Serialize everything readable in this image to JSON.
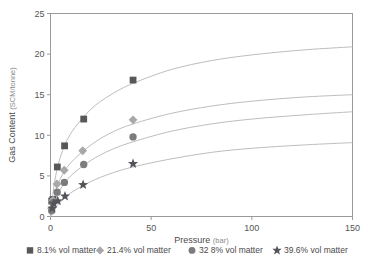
{
  "chart_data": {
    "type": "scatter",
    "title": "",
    "xlabel": "Pressure",
    "xunit": "(bar)",
    "ylabel": "Gas Content",
    "yunit": "(SCM/tonne)",
    "xlim": [
      0,
      150
    ],
    "ylim": [
      0,
      25
    ],
    "xticks": [
      0,
      50,
      100,
      150
    ],
    "yticks": [
      0,
      5,
      10,
      15,
      20,
      25
    ],
    "grid": false,
    "legend_position": "below",
    "series": [
      {
        "name": "8.1%  vol matter",
        "marker": "square",
        "color": "#58585a",
        "points": [
          {
            "x": 0.6,
            "y": 1.9
          },
          {
            "x": 1.2,
            "y": 2.1
          },
          {
            "x": 3.4,
            "y": 6.1
          },
          {
            "x": 7.0,
            "y": 8.7
          },
          {
            "x": 16.5,
            "y": 12.0
          },
          {
            "x": 41.0,
            "y": 16.8
          }
        ],
        "curve": [
          {
            "x": 0,
            "y": 0
          },
          {
            "x": 2,
            "y": 4.2
          },
          {
            "x": 5,
            "y": 7.4
          },
          {
            "x": 10,
            "y": 10.2
          },
          {
            "x": 20,
            "y": 13.2
          },
          {
            "x": 30,
            "y": 15.0
          },
          {
            "x": 41,
            "y": 16.4
          },
          {
            "x": 60,
            "y": 18.1
          },
          {
            "x": 80,
            "y": 19.2
          },
          {
            "x": 100,
            "y": 19.9
          },
          {
            "x": 125,
            "y": 20.5
          },
          {
            "x": 150,
            "y": 20.9
          }
        ]
      },
      {
        "name": "21.4% vol matter",
        "marker": "diamond",
        "color": "#a8a8aa",
        "points": [
          {
            "x": 0.6,
            "y": 1.0
          },
          {
            "x": 1.2,
            "y": 2.0
          },
          {
            "x": 3.2,
            "y": 4.0
          },
          {
            "x": 6.8,
            "y": 5.7
          },
          {
            "x": 16.0,
            "y": 8.1
          },
          {
            "x": 41.0,
            "y": 11.9
          }
        ],
        "curve": [
          {
            "x": 0,
            "y": 0
          },
          {
            "x": 2,
            "y": 2.6
          },
          {
            "x": 5,
            "y": 4.7
          },
          {
            "x": 10,
            "y": 6.6
          },
          {
            "x": 20,
            "y": 8.8
          },
          {
            "x": 30,
            "y": 10.3
          },
          {
            "x": 41,
            "y": 11.4
          },
          {
            "x": 60,
            "y": 12.7
          },
          {
            "x": 80,
            "y": 13.6
          },
          {
            "x": 100,
            "y": 14.2
          },
          {
            "x": 125,
            "y": 14.7
          },
          {
            "x": 150,
            "y": 15.0
          }
        ]
      },
      {
        "name": "32 8% vol matter",
        "marker": "circle",
        "color": "#7c7c7e",
        "points": [
          {
            "x": 0.6,
            "y": 0.7
          },
          {
            "x": 1.2,
            "y": 1.7
          },
          {
            "x": 3.3,
            "y": 3.0
          },
          {
            "x": 6.9,
            "y": 4.2
          },
          {
            "x": 16.5,
            "y": 6.4
          },
          {
            "x": 41.0,
            "y": 9.8
          }
        ],
        "curve": [
          {
            "x": 0,
            "y": 0
          },
          {
            "x": 2,
            "y": 1.8
          },
          {
            "x": 5,
            "y": 3.4
          },
          {
            "x": 10,
            "y": 5.0
          },
          {
            "x": 20,
            "y": 6.9
          },
          {
            "x": 30,
            "y": 8.2
          },
          {
            "x": 41,
            "y": 9.2
          },
          {
            "x": 60,
            "y": 10.5
          },
          {
            "x": 80,
            "y": 11.4
          },
          {
            "x": 100,
            "y": 12.0
          },
          {
            "x": 125,
            "y": 12.5
          },
          {
            "x": 150,
            "y": 12.9
          }
        ]
      },
      {
        "name": "39.6% vol matter",
        "marker": "star",
        "color": "#54545a",
        "points": [
          {
            "x": 0.9,
            "y": 1.0
          },
          {
            "x": 1.6,
            "y": 1.6
          },
          {
            "x": 3.6,
            "y": 1.9
          },
          {
            "x": 7.2,
            "y": 2.5
          },
          {
            "x": 16.2,
            "y": 3.9
          },
          {
            "x": 41.0,
            "y": 6.5
          }
        ],
        "curve": [
          {
            "x": 0,
            "y": 0
          },
          {
            "x": 2,
            "y": 0.9
          },
          {
            "x": 5,
            "y": 1.8
          },
          {
            "x": 10,
            "y": 2.9
          },
          {
            "x": 20,
            "y": 4.3
          },
          {
            "x": 30,
            "y": 5.3
          },
          {
            "x": 41,
            "y": 6.1
          },
          {
            "x": 60,
            "y": 7.1
          },
          {
            "x": 80,
            "y": 7.9
          },
          {
            "x": 100,
            "y": 8.4
          },
          {
            "x": 125,
            "y": 8.8
          },
          {
            "x": 150,
            "y": 9.1
          }
        ]
      }
    ]
  },
  "legend": {
    "items": [
      {
        "label": "8.1%  vol matter"
      },
      {
        "label": "21.4% vol matter"
      },
      {
        "label": "32 8% vol matter"
      },
      {
        "label": "39.6% vol matter"
      }
    ]
  }
}
